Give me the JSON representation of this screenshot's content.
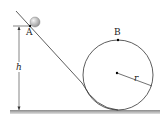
{
  "diagram": {
    "type": "loop-the-loop track",
    "labels": {
      "point_a": "A",
      "point_b": "B",
      "height": "h",
      "radius": "r"
    },
    "elements": [
      "ball",
      "incline",
      "circular-loop",
      "ground",
      "height-dimension",
      "radius-line"
    ],
    "colors": {
      "line": "#333333",
      "ground": "#9a9a9a",
      "ball": "#c8c8c8"
    }
  }
}
